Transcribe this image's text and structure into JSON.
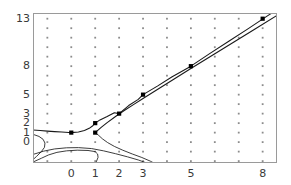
{
  "figure": {
    "background_color": "#ffffff",
    "frame_color": "#9a9a9a",
    "grid_dot_color": "#8c8c8c",
    "curve_color": "#1a1a1a",
    "point_color": "#000000",
    "tick_text_color": "#3a3a3a"
  },
  "chart_data": {
    "type": "line",
    "title": "",
    "subtitle": "",
    "xlabel": "",
    "ylabel": "",
    "xlim": [
      -1.6,
      8.6
    ],
    "ylim": [
      -2.2,
      13.6
    ],
    "grid": true,
    "grid_style": "dotted-points",
    "legend": null,
    "xticks": [
      0,
      1,
      2,
      3,
      5,
      8
    ],
    "xtick_labels": [
      "0",
      "1",
      "2",
      "3",
      "5",
      "8"
    ],
    "yticks": [
      0,
      1,
      2,
      3,
      5,
      8,
      13
    ],
    "ytick_labels": [
      "0",
      "1",
      "2",
      "3",
      "5",
      "8",
      "13"
    ],
    "annotations": [],
    "series": [
      {
        "name": "upper-branch",
        "type": "line",
        "points": [
          [
            -1.6,
            1.28
          ],
          [
            -1.3,
            1.22
          ],
          [
            -1.0,
            1.16
          ],
          [
            -0.7,
            1.11
          ],
          [
            -0.4,
            1.07
          ],
          [
            -0.1,
            1.02
          ],
          [
            0.0,
            1.0
          ],
          [
            0.3,
            1.06
          ],
          [
            0.55,
            1.22
          ],
          [
            0.75,
            1.45
          ],
          [
            0.9,
            1.73
          ],
          [
            1.0,
            2.0
          ],
          [
            1.2,
            2.34
          ],
          [
            1.5,
            2.7
          ],
          [
            1.8,
            3.1
          ],
          [
            2.0,
            3.0
          ],
          [
            2.4,
            3.85
          ],
          [
            2.8,
            4.5
          ],
          [
            3.0,
            5.0
          ],
          [
            3.6,
            5.9
          ],
          [
            4.2,
            6.85
          ],
          [
            5.0,
            8.0
          ],
          [
            5.8,
            9.35
          ],
          [
            6.6,
            10.65
          ],
          [
            7.4,
            11.95
          ],
          [
            8.2,
            13.3
          ],
          [
            8.6,
            13.95
          ]
        ]
      },
      {
        "name": "companion-branch",
        "type": "line",
        "points": [
          [
            1.0,
            1.0
          ],
          [
            1.25,
            1.55
          ],
          [
            1.5,
            2.05
          ],
          [
            1.85,
            2.7
          ],
          [
            2.2,
            3.3
          ],
          [
            2.6,
            3.95
          ],
          [
            3.0,
            4.6
          ],
          [
            3.6,
            5.55
          ],
          [
            4.3,
            6.65
          ],
          [
            5.0,
            7.75
          ],
          [
            5.9,
            9.15
          ],
          [
            6.8,
            10.55
          ],
          [
            7.7,
            11.95
          ],
          [
            8.6,
            13.35
          ]
        ]
      },
      {
        "name": "lower-left-branch-a",
        "type": "line",
        "points": [
          [
            -1.6,
            0.82
          ],
          [
            -1.35,
            0.6
          ],
          [
            -1.18,
            0.3
          ],
          [
            -1.1,
            -0.1
          ],
          [
            -1.12,
            -0.55
          ],
          [
            -1.25,
            -1.0
          ],
          [
            -1.45,
            -1.5
          ],
          [
            -1.6,
            -1.85
          ]
        ]
      },
      {
        "name": "lower-left-branch-b",
        "type": "line",
        "points": [
          [
            -1.6,
            -2.1
          ],
          [
            -1.25,
            -1.7
          ],
          [
            -0.95,
            -1.35
          ],
          [
            -0.6,
            -1.08
          ],
          [
            -0.2,
            -0.92
          ],
          [
            0.25,
            -0.85
          ],
          [
            0.7,
            -0.88
          ],
          [
            1.0,
            -1.0
          ],
          [
            1.1,
            -1.25
          ],
          [
            1.12,
            -1.6
          ],
          [
            1.05,
            -2.05
          ]
        ]
      },
      {
        "name": "saddle-branch-right",
        "type": "line",
        "points": [
          [
            1.0,
            1.0
          ],
          [
            1.15,
            0.7
          ],
          [
            1.3,
            0.35
          ],
          [
            1.52,
            -0.05
          ],
          [
            1.8,
            -0.45
          ],
          [
            2.15,
            -0.85
          ],
          [
            2.55,
            -1.25
          ],
          [
            2.95,
            -1.62
          ],
          [
            3.3,
            -2.0
          ],
          [
            3.45,
            -2.2
          ]
        ]
      },
      {
        "name": "saddle-branch-low",
        "type": "line",
        "points": [
          [
            -1.6,
            -1.3
          ],
          [
            -1.15,
            -0.95
          ],
          [
            -0.7,
            -0.72
          ],
          [
            -0.2,
            -0.6
          ],
          [
            0.3,
            -0.58
          ],
          [
            0.85,
            -0.68
          ],
          [
            1.35,
            -0.92
          ],
          [
            1.85,
            -1.22
          ],
          [
            2.35,
            -1.55
          ],
          [
            2.8,
            -1.88
          ],
          [
            3.15,
            -2.2
          ]
        ]
      }
    ],
    "marked_points": {
      "name": "fibonacci-points",
      "type": "scatter",
      "points": [
        [
          0,
          1
        ],
        [
          1,
          1
        ],
        [
          1,
          2
        ],
        [
          2,
          3
        ],
        [
          3,
          5
        ],
        [
          5,
          8
        ],
        [
          8,
          13
        ]
      ]
    }
  }
}
